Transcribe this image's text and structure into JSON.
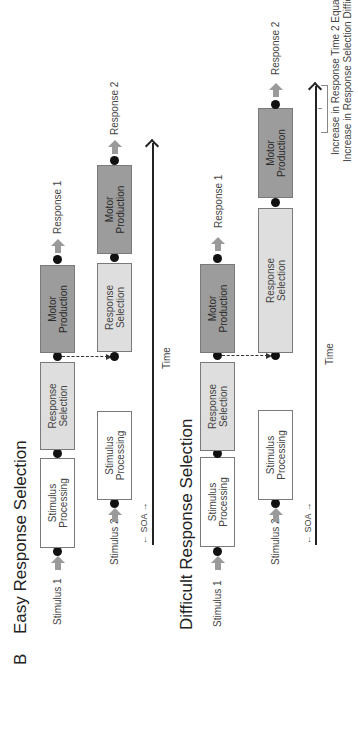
{
  "figure": {
    "panel_letter": "B",
    "orientation": "rotated-90-ccw"
  },
  "easy": {
    "title": "Easy Response Selection",
    "task1": {
      "stimulus_label": "Stimulus 1",
      "stimulus_processing": "Stimulus Processing",
      "response_selection": "Response Selection",
      "motor_production": "Motor Production",
      "response_label": "Response 1"
    },
    "task2": {
      "stimulus_label": "Stimulus 2",
      "stimulus_processing": "Stimulus Processing",
      "response_selection": "Response Selection",
      "motor_production": "Motor Production",
      "response_label": "Response 2"
    },
    "soa_label": "SOA",
    "time_label": "Time"
  },
  "difficult": {
    "title": "Difficult Response Selection",
    "task1": {
      "stimulus_label": "Stimulus 1",
      "stimulus_processing": "Stimulus Processing",
      "response_selection": "Response Selection",
      "motor_production": "Motor Production",
      "response_label": "Response 1"
    },
    "task2": {
      "stimulus_label": "Stimulus 2",
      "stimulus_processing": "Stimulus Processing",
      "response_selection": "Response Selection",
      "motor_production": "Motor Production",
      "response_label": "Response 2"
    },
    "soa_label": "SOA",
    "time_label": "Time",
    "note_line1": "Increase in Response Time 2 Equal to",
    "note_line2": "Increase in Response Selection Difficulty"
  },
  "colors": {
    "stimulus_box": "#ffffff",
    "response_selection_box": "#dedede",
    "motor_production_box": "#9c9c9c",
    "arrow_gray": "#9a9a9a",
    "dot": "#111111"
  }
}
